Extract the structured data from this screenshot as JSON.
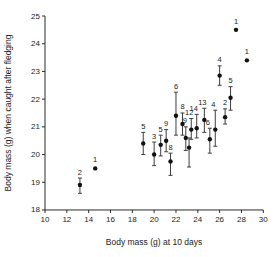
{
  "chart_data": {
    "type": "scatter",
    "title": "",
    "xlabel": "Body mass (g) at 10 days",
    "ylabel": "Body mass (g) when caught after fledging",
    "xlim": [
      10,
      30
    ],
    "ylim": [
      18,
      25
    ],
    "xticks": [
      10,
      12,
      14,
      16,
      18,
      20,
      22,
      24,
      26,
      28,
      30
    ],
    "yticks": [
      18,
      19,
      20,
      21,
      22,
      23,
      24,
      25
    ],
    "grid": false,
    "legend": false,
    "marker_color": "#111111",
    "error_bar_color": "#3d3d3d",
    "axis_color": "#2b2b2b",
    "point_label_meaning": "sample size above each point",
    "points": [
      {
        "x": 13.2,
        "y": 18.9,
        "n": "2",
        "lo": 18.6,
        "hi": 19.15
      },
      {
        "x": 14.6,
        "y": 19.5,
        "n": "1"
      },
      {
        "x": 19.0,
        "y": 20.4,
        "n": "5",
        "lo": 20.0,
        "hi": 20.8
      },
      {
        "x": 20.0,
        "y": 20.0,
        "n": "3",
        "lo": 19.6,
        "hi": 20.45
      },
      {
        "x": 20.6,
        "y": 20.35,
        "n": "5",
        "lo": 19.95,
        "hi": 20.7
      },
      {
        "x": 21.1,
        "y": 20.5,
        "n": "9",
        "lo": 20.1,
        "hi": 20.9
      },
      {
        "x": 21.5,
        "y": 19.75,
        "n": "8",
        "lo": 19.25,
        "hi": 20.05
      },
      {
        "x": 22.0,
        "y": 21.4,
        "n": "6",
        "lo": 20.7,
        "hi": 22.25
      },
      {
        "x": 22.6,
        "y": 21.1,
        "n": "8",
        "lo": 20.7,
        "hi": 21.5
      },
      {
        "x": 22.9,
        "y": 20.6,
        "n": "9",
        "lo": 20.15,
        "hi": 21.0,
        "dx": -1
      },
      {
        "x": 23.2,
        "y": 20.25,
        "n": "",
        "lo": 19.55,
        "hi": 20.6
      },
      {
        "x": 23.4,
        "y": 20.9,
        "n": "12",
        "lo": 20.55,
        "hi": 21.3,
        "dx": -2
      },
      {
        "x": 23.9,
        "y": 20.95,
        "n": "14",
        "lo": 20.6,
        "hi": 21.45,
        "dx": -3
      },
      {
        "x": 24.6,
        "y": 21.25,
        "n": "13",
        "lo": 20.8,
        "hi": 21.67,
        "dx": -2
      },
      {
        "x": 25.1,
        "y": 20.55,
        "n": "6",
        "lo": 20.05,
        "hi": 20.95,
        "dx": -2
      },
      {
        "x": 25.6,
        "y": 20.9,
        "n": "4",
        "lo": 20.3,
        "hi": 21.6,
        "dx": -2
      },
      {
        "x": 26.0,
        "y": 22.85,
        "n": "4",
        "lo": 22.5,
        "hi": 23.2
      },
      {
        "x": 26.5,
        "y": 21.35,
        "n": "2",
        "lo": 21.1,
        "hi": 21.65
      },
      {
        "x": 27.0,
        "y": 22.05,
        "n": "5",
        "lo": 21.6,
        "hi": 22.45
      },
      {
        "x": 27.5,
        "y": 24.5,
        "n": "1"
      },
      {
        "x": 28.5,
        "y": 23.4,
        "n": "1"
      }
    ]
  }
}
